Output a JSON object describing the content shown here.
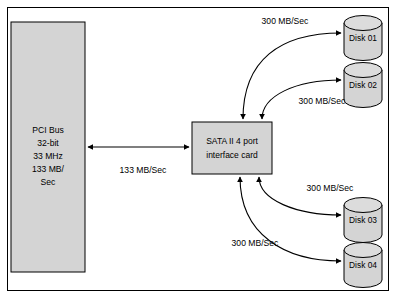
{
  "diagram": {
    "colors": {
      "shape_fill": "#d4d4d4",
      "disk_top_fill": "#dcdcdc",
      "stroke": "#000000",
      "background": "#ffffff"
    },
    "pci_bus": {
      "name": "pci-bus-block",
      "lines": [
        "PCI Bus",
        "32-bit",
        "33 MHz",
        "133 MB/",
        "Sec"
      ]
    },
    "interface_card": {
      "name": "sata-interface-card",
      "line1": "SATA II 4 port",
      "line2": "interface card"
    },
    "disks": [
      {
        "id": "disk-01",
        "label": "Disk 01"
      },
      {
        "id": "disk-02",
        "label": "Disk 02"
      },
      {
        "id": "disk-03",
        "label": "Disk 03"
      },
      {
        "id": "disk-04",
        "label": "Disk 04"
      }
    ],
    "edges": [
      {
        "id": "pci-to-card",
        "label": "133 MB/Sec"
      },
      {
        "id": "card-to-disk-01",
        "label": "300 MB/Sec"
      },
      {
        "id": "card-to-disk-02",
        "label": "300 MB/Sec"
      },
      {
        "id": "card-to-disk-03",
        "label": "300 MB/Sec"
      },
      {
        "id": "card-to-disk-04",
        "label": "300 MB/Sec"
      }
    ]
  }
}
